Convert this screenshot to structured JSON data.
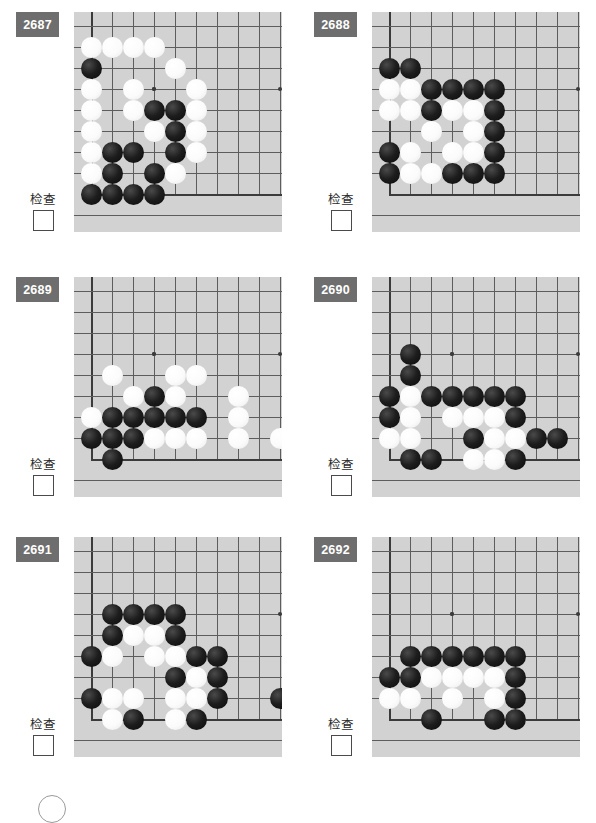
{
  "page": {
    "background_color": "#ffffff",
    "board_color": "#d2d2d2",
    "badge_color": "#6e6e6e",
    "line_color": "#5d5d5d",
    "columns": 2,
    "rows": 3
  },
  "labels": {
    "check_text": "检查",
    "checkbox_checked": false
  },
  "board_geometry": {
    "cols": 9,
    "rows": 9,
    "cell": 21,
    "origin_x": 17,
    "origin_y": 14,
    "star_points": [
      [
        3,
        3
      ]
    ],
    "edge_left_col": 0,
    "edge_bottom_row": 8
  },
  "puzzles": [
    {
      "id": "2687",
      "check_text": "检查",
      "black": [
        [
          0,
          2
        ],
        [
          3,
          4
        ],
        [
          4,
          4
        ],
        [
          4,
          5
        ],
        [
          1,
          6
        ],
        [
          2,
          6
        ],
        [
          4,
          6
        ],
        [
          1,
          7
        ],
        [
          3,
          7
        ],
        [
          0,
          8
        ],
        [
          1,
          8
        ],
        [
          2,
          8
        ],
        [
          3,
          8
        ]
      ],
      "white": [
        [
          0,
          1
        ],
        [
          1,
          1
        ],
        [
          2,
          1
        ],
        [
          3,
          1
        ],
        [
          4,
          2
        ],
        [
          0,
          3
        ],
        [
          2,
          3
        ],
        [
          5,
          3
        ],
        [
          0,
          4
        ],
        [
          2,
          4
        ],
        [
          3,
          4.0001
        ],
        [
          5,
          4
        ],
        [
          0,
          5
        ],
        [
          3,
          5
        ],
        [
          5,
          5
        ],
        [
          0,
          6
        ],
        [
          5,
          6
        ],
        [
          0,
          7
        ],
        [
          4,
          7
        ]
      ]
    },
    {
      "id": "2688",
      "check_text": "检查",
      "black": [
        [
          0,
          2
        ],
        [
          1,
          2
        ],
        [
          2,
          3
        ],
        [
          3,
          3
        ],
        [
          4,
          3
        ],
        [
          5,
          3
        ],
        [
          2,
          4
        ],
        [
          5,
          4
        ],
        [
          5,
          5
        ],
        [
          0,
          6
        ],
        [
          5,
          6
        ],
        [
          0,
          7
        ],
        [
          3,
          7
        ],
        [
          4,
          7
        ],
        [
          5,
          7
        ]
      ],
      "white": [
        [
          0,
          3
        ],
        [
          1,
          3
        ],
        [
          0,
          4
        ],
        [
          1,
          4
        ],
        [
          3,
          4
        ],
        [
          4,
          4
        ],
        [
          2,
          5
        ],
        [
          4,
          5
        ],
        [
          1,
          6
        ],
        [
          3,
          6
        ],
        [
          4,
          6
        ],
        [
          1,
          7
        ],
        [
          2,
          7
        ]
      ]
    },
    {
      "id": "2689",
      "check_text": "检查",
      "black": [
        [
          3,
          5
        ],
        [
          1,
          6
        ],
        [
          2,
          6
        ],
        [
          3,
          6
        ],
        [
          4,
          6
        ],
        [
          5,
          6
        ],
        [
          0,
          7
        ],
        [
          1,
          7
        ],
        [
          2,
          7
        ],
        [
          1,
          8
        ]
      ],
      "white": [
        [
          1,
          4
        ],
        [
          4,
          4
        ],
        [
          5,
          4
        ],
        [
          2,
          5
        ],
        [
          3,
          5.0001
        ],
        [
          4,
          5
        ],
        [
          7,
          5
        ],
        [
          0,
          6
        ],
        [
          7,
          6
        ],
        [
          3,
          7
        ],
        [
          4,
          7
        ],
        [
          5,
          7
        ],
        [
          7,
          7
        ],
        [
          9,
          7
        ]
      ]
    },
    {
      "id": "2690",
      "check_text": "检查",
      "black": [
        [
          1,
          3
        ],
        [
          1,
          4
        ],
        [
          0,
          5
        ],
        [
          2,
          5
        ],
        [
          3,
          5
        ],
        [
          4,
          5
        ],
        [
          5,
          5
        ],
        [
          6,
          5
        ],
        [
          0,
          6
        ],
        [
          6,
          6
        ],
        [
          4,
          7
        ],
        [
          7,
          7
        ],
        [
          8,
          7
        ],
        [
          1,
          8
        ],
        [
          2,
          8
        ],
        [
          6,
          8
        ]
      ],
      "white": [
        [
          1,
          5
        ],
        [
          1,
          6
        ],
        [
          3,
          6
        ],
        [
          4,
          6
        ],
        [
          5,
          6
        ],
        [
          0,
          7
        ],
        [
          1,
          7
        ],
        [
          5,
          7
        ],
        [
          6,
          7
        ],
        [
          4,
          8
        ],
        [
          5,
          8
        ]
      ]
    },
    {
      "id": "2691",
      "check_text": "检查",
      "black": [
        [
          1,
          3
        ],
        [
          2,
          3
        ],
        [
          3,
          3
        ],
        [
          4,
          3
        ],
        [
          1,
          4
        ],
        [
          4,
          4
        ],
        [
          0,
          5
        ],
        [
          5,
          5
        ],
        [
          6,
          5
        ],
        [
          4,
          6
        ],
        [
          6,
          6
        ],
        [
          0,
          7
        ],
        [
          6,
          7
        ],
        [
          9,
          7
        ],
        [
          2,
          8
        ],
        [
          5,
          8
        ]
      ],
      "white": [
        [
          2,
          4
        ],
        [
          3,
          4
        ],
        [
          1,
          5
        ],
        [
          3,
          5
        ],
        [
          4,
          5
        ],
        [
          5,
          6
        ],
        [
          1,
          7
        ],
        [
          2,
          7
        ],
        [
          4,
          7
        ],
        [
          5,
          7
        ],
        [
          1,
          8
        ],
        [
          4,
          8
        ]
      ]
    },
    {
      "id": "2692",
      "check_text": "检查",
      "black": [
        [
          1,
          5
        ],
        [
          2,
          5
        ],
        [
          3,
          5
        ],
        [
          4,
          5
        ],
        [
          5,
          5
        ],
        [
          6,
          5
        ],
        [
          0,
          6
        ],
        [
          1,
          6
        ],
        [
          6,
          6
        ],
        [
          6,
          7
        ],
        [
          2,
          8
        ],
        [
          5,
          8
        ],
        [
          6,
          8
        ]
      ],
      "white": [
        [
          2,
          6
        ],
        [
          3,
          6
        ],
        [
          4,
          6
        ],
        [
          5,
          6
        ],
        [
          0,
          7
        ],
        [
          1,
          7
        ],
        [
          3,
          7
        ],
        [
          5,
          7
        ],
        [
          6,
          8.0001
        ]
      ]
    }
  ]
}
